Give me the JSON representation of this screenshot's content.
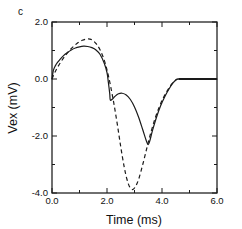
{
  "panel": {
    "label": "c"
  },
  "chart_data": {
    "type": "line",
    "title": "",
    "subtitle": "",
    "xlabel": "Time  (ms)",
    "ylabel": "Vex  (mV)",
    "xlim": [
      0.0,
      6.0
    ],
    "ylim": [
      -4.0,
      2.0
    ],
    "xticks": [
      0.0,
      2.0,
      4.0,
      6.0
    ],
    "yticks": [
      2.0,
      0.0,
      -2.0,
      -4.0
    ],
    "xticklabels": [
      "0.0",
      "2.0",
      "4.0",
      "6.0"
    ],
    "yticklabels": [
      "2.0",
      "0.0",
      "-2.0",
      "-4.0"
    ],
    "xminorticks": [
      1.0,
      3.0,
      5.0
    ],
    "yminorticks": [
      1.0,
      -1.0,
      -3.0
    ],
    "grid": false,
    "legend": null,
    "legend_position": "none",
    "frame": "box",
    "tick_direction": "in",
    "annotations": [],
    "series": [
      {
        "name": "solid",
        "style": "solid",
        "color": "#1a1a1a",
        "x": [
          0.0,
          0.05,
          0.12,
          0.2,
          0.3,
          0.42,
          0.55,
          0.7,
          0.85,
          1.0,
          1.15,
          1.3,
          1.45,
          1.6,
          1.75,
          1.9,
          2.0,
          2.05,
          2.1,
          2.12,
          2.2,
          2.3,
          2.42,
          2.55,
          2.7,
          2.85,
          3.0,
          3.15,
          3.3,
          3.42,
          3.5,
          3.56,
          3.65,
          3.8,
          3.95,
          4.1,
          4.25,
          4.4,
          4.52,
          4.6,
          5.0,
          5.5,
          6.0
        ],
        "y": [
          0.0,
          0.3,
          0.46,
          0.58,
          0.7,
          0.82,
          0.92,
          1.02,
          1.09,
          1.13,
          1.15,
          1.14,
          1.1,
          1.02,
          0.86,
          0.55,
          0.22,
          -0.12,
          -0.52,
          -0.74,
          -0.7,
          -0.6,
          -0.52,
          -0.5,
          -0.56,
          -0.72,
          -0.98,
          -1.34,
          -1.78,
          -2.14,
          -2.3,
          -2.16,
          -1.82,
          -1.34,
          -0.94,
          -0.62,
          -0.36,
          -0.14,
          -0.03,
          0.0,
          0.0,
          0.0,
          0.0
        ]
      },
      {
        "name": "dashed",
        "style": "dashed",
        "color": "#1a1a1a",
        "x": [
          0.0,
          0.1,
          0.22,
          0.35,
          0.5,
          0.65,
          0.8,
          0.95,
          1.1,
          1.25,
          1.38,
          1.5,
          1.62,
          1.75,
          1.88,
          2.0,
          2.12,
          2.25,
          2.38,
          2.5,
          2.62,
          2.72,
          2.82,
          2.92,
          3.02,
          3.15,
          3.3,
          3.45,
          3.6,
          3.75,
          3.9,
          4.05,
          4.2,
          4.35,
          4.48,
          4.58,
          5.0,
          5.5,
          6.0
        ],
        "y": [
          0.0,
          0.22,
          0.44,
          0.64,
          0.84,
          1.02,
          1.16,
          1.28,
          1.36,
          1.4,
          1.4,
          1.34,
          1.22,
          1.02,
          0.72,
          0.32,
          -0.2,
          -0.86,
          -1.62,
          -2.38,
          -3.06,
          -3.5,
          -3.78,
          -3.88,
          -3.8,
          -3.52,
          -3.0,
          -2.42,
          -1.86,
          -1.38,
          -0.98,
          -0.66,
          -0.4,
          -0.18,
          -0.05,
          0.0,
          0.0,
          0.0,
          0.0
        ]
      }
    ],
    "flat_baseline": {
      "name": "zero-baseline",
      "x_start": 4.6,
      "x_end": 6.0,
      "y": 0.0
    }
  }
}
